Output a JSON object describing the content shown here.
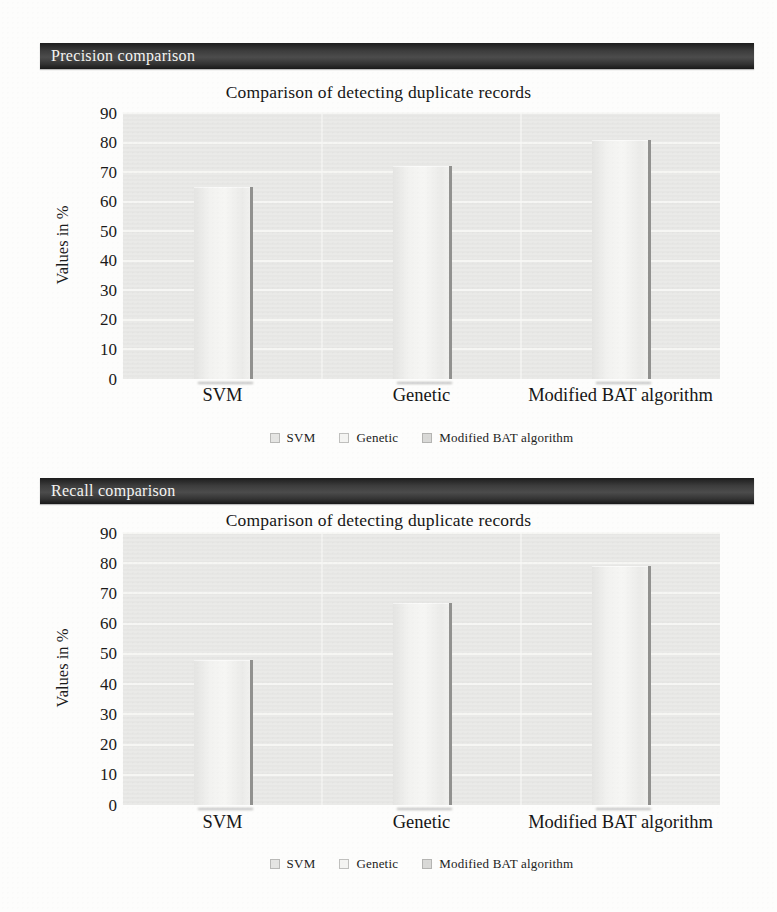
{
  "chart_data": [
    {
      "type": "bar",
      "section_header": "Precision comparison",
      "title": "Comparison of detecting duplicate records",
      "ylabel": "Values in %",
      "ylim": [
        0,
        90
      ],
      "yticks": [
        90,
        80,
        70,
        60,
        50,
        40,
        30,
        20,
        10,
        0
      ],
      "categories": [
        "SVM",
        "Genetic",
        "Modified BAT algorithm"
      ],
      "values": [
        65,
        72,
        81
      ],
      "legend": [
        "SVM",
        "Genetic",
        "Modified BAT algorithm"
      ],
      "legend_position": "bottom",
      "grid": true
    },
    {
      "type": "bar",
      "section_header": "Recall comparison",
      "title": "Comparison of detecting duplicate records",
      "ylabel": "Values in %",
      "ylim": [
        0,
        90
      ],
      "yticks": [
        90,
        80,
        70,
        60,
        50,
        40,
        30,
        20,
        10,
        0
      ],
      "categories": [
        "SVM",
        "Genetic",
        "Modified BAT algorithm"
      ],
      "values": [
        48,
        67,
        79
      ],
      "legend": [
        "SVM",
        "Genetic",
        "Modified BAT algorithm"
      ],
      "legend_position": "bottom",
      "grid": true
    }
  ],
  "colors": {
    "page_bg": "#fdfdfc",
    "header_bar": "#3d3d3d",
    "header_text": "#f4f4f2",
    "text": "#1a1a1a",
    "plot_bg": "#e9e9e7",
    "gridline": "#f8f8f6",
    "bar_light": "#f6f6f4",
    "bar_edge": "#91918f",
    "legend_markers": [
      "#e5e5e3",
      "#f4f4f2",
      "#d9d9d7"
    ]
  }
}
